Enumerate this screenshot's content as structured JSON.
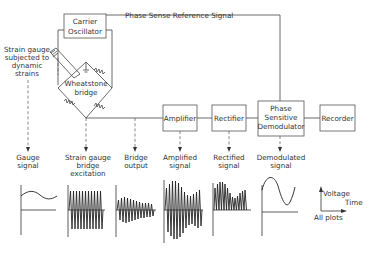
{
  "diagram": {
    "blocks": {
      "carrier_oscillator": [
        "Carrier",
        "Oscillator"
      ],
      "wheatstone_bridge": [
        "Wheatstone",
        "bridge"
      ],
      "amplifier": "Amplifier",
      "rectifier": "Rectifier",
      "phase_sensitive_demodulator": [
        "Phase",
        "Sensitive",
        "Demodulator"
      ],
      "recorder": "Recorder"
    },
    "reference_line_label": "Phase Sense Reference Signal",
    "strain_gauge_label": [
      "Strain gauge",
      "subjected to",
      "dynamic",
      "strains"
    ],
    "signal_labels": {
      "gauge": [
        "Gauge",
        "signal"
      ],
      "excitation": [
        "Strain gauge",
        "bridge",
        "excitation"
      ],
      "bridge_output": [
        "Bridge",
        "output"
      ],
      "amplified": [
        "Amplified",
        "signal"
      ],
      "rectified": [
        "Rectified",
        "signal"
      ],
      "demodulated": [
        "Demodulated",
        "signal"
      ]
    },
    "legend": {
      "y_axis": "Voltage",
      "x_axis": "Time",
      "note": "All plots"
    }
  }
}
